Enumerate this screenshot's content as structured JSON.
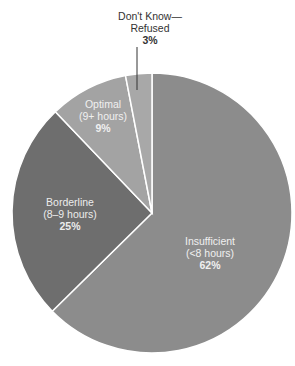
{
  "chart_data": {
    "type": "pie",
    "title": "",
    "categories": [
      "Insufficient (<8 hours)",
      "Borderline (8–9 hours)",
      "Optimal (9+ hours)",
      "Don't Know—Refused"
    ],
    "values": [
      62,
      25,
      9,
      3
    ],
    "unit": "%",
    "colors": [
      "#8c8c8c",
      "#6e6e6e",
      "#a3a3a3",
      "#a8a8a8"
    ],
    "start_angle_deg": 0,
    "direction": "clockwise",
    "legend": "none (direct labels)"
  },
  "labels": {
    "insufficient": {
      "line1": "Insufficient",
      "line2": "(<8 hours)",
      "pct": "62%"
    },
    "borderline": {
      "line1": "Borderline",
      "line2": "(8–9 hours)",
      "pct": "25%"
    },
    "optimal": {
      "line1": "Optimal",
      "line2": "(9+ hours)",
      "pct": "9%"
    },
    "dontknow": {
      "line1": "Don't Know—",
      "line2": "Refused",
      "pct": "3%"
    }
  }
}
